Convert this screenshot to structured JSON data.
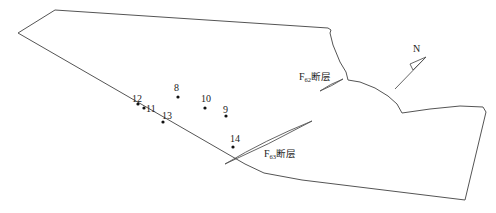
{
  "diagram": {
    "type": "geological-site-map",
    "colors": {
      "background": "#ffffff",
      "line": "#555555",
      "text": "#222222",
      "point": "#111111"
    },
    "boundary": {
      "points": [
        [
          55,
          10
        ],
        [
          328,
          28
        ],
        [
          331,
          30
        ],
        [
          330,
          33
        ],
        [
          333,
          45
        ],
        [
          340,
          62
        ],
        [
          346,
          72
        ],
        [
          348,
          80
        ],
        [
          360,
          82
        ],
        [
          375,
          88
        ],
        [
          388,
          96
        ],
        [
          397,
          104
        ],
        [
          402,
          113
        ],
        [
          430,
          109
        ],
        [
          460,
          106
        ],
        [
          483,
          107
        ],
        [
          486,
          112
        ],
        [
          465,
          200
        ],
        [
          302,
          180
        ],
        [
          264,
          173
        ],
        [
          245,
          164
        ],
        [
          18,
          33
        ]
      ]
    },
    "points": [
      {
        "id": "8",
        "x": 178,
        "y": 97,
        "label_x": 174,
        "label_y": 91,
        "label": "8"
      },
      {
        "id": "10",
        "x": 205,
        "y": 108,
        "label_x": 201,
        "label_y": 102,
        "label": "10"
      },
      {
        "id": "9",
        "x": 226,
        "y": 116,
        "label_x": 223,
        "label_y": 113,
        "label": "9"
      },
      {
        "id": "12",
        "x": 138,
        "y": 104,
        "label_x": 132,
        "label_y": 102,
        "label": "12"
      },
      {
        "id": "11",
        "x": 144,
        "y": 108,
        "label_x": 146,
        "label_y": 112,
        "label": "11"
      },
      {
        "id": "13",
        "x": 163,
        "y": 122,
        "label_x": 162,
        "label_y": 119,
        "label": "13"
      },
      {
        "id": "14",
        "x": 233,
        "y": 147,
        "label_x": 230,
        "label_y": 142,
        "label": "14"
      }
    ],
    "faults": [
      {
        "id": "F62",
        "label_main": "F",
        "label_sub": "62",
        "label_suffix": "断层",
        "label_x": 299,
        "label_y": 80,
        "lens": "M 320 91 Q 330 84 343 79 Q 332 86 320 91 Z"
      },
      {
        "id": "F63",
        "label_main": "F",
        "label_sub": "63",
        "label_suffix": "断层",
        "label_x": 264,
        "label_y": 157,
        "lens": "M 225 164 Q 265 140 312 121 Q 268 145 225 164 Z"
      }
    ],
    "north_arrow": {
      "label": "N",
      "label_x": 413,
      "label_y": 52,
      "shaft": [
        [
          395,
          89
        ],
        [
          426,
          57
        ]
      ],
      "head": [
        [
          426,
          57
        ],
        [
          410,
          64
        ],
        [
          413,
          70
        ]
      ]
    }
  }
}
